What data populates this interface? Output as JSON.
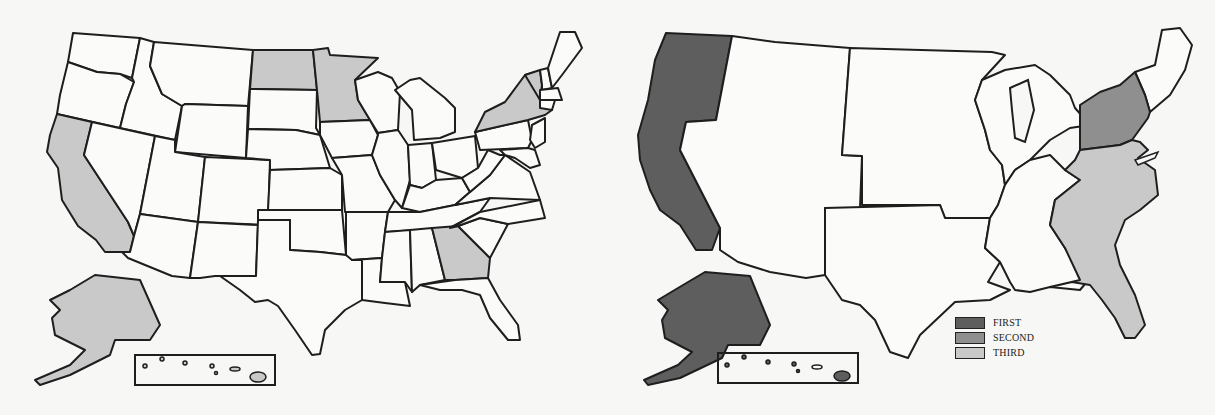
{
  "colors": {
    "background": "#f7f7f5",
    "first": "#5e5e5e",
    "second": "#8f8f8f",
    "third": "#c9c9c9",
    "unshaded": "#fbfbfa",
    "border": "#1e1e1e"
  },
  "left_map": {
    "description": "US states map with individual states shaded",
    "shaded_states": [
      {
        "state": "California",
        "level": "third"
      },
      {
        "state": "North Dakota",
        "level": "third"
      },
      {
        "state": "Minnesota",
        "level": "third"
      },
      {
        "state": "New York",
        "level": "third"
      },
      {
        "state": "Vermont",
        "level": "third"
      },
      {
        "state": "Georgia",
        "level": "third"
      },
      {
        "state": "Alaska",
        "level": "third"
      },
      {
        "state": "Hawaii",
        "level": "third"
      }
    ]
  },
  "right_map": {
    "description": "US regions map with regions shaded",
    "shaded_regions": [
      {
        "region": "Pacific (WA, OR, CA)",
        "level": "first"
      },
      {
        "region": "Alaska",
        "level": "first"
      },
      {
        "region": "Hawaii",
        "level": "first"
      },
      {
        "region": "Mid-Atlantic (NY, NJ, PA)",
        "level": "second"
      },
      {
        "region": "South Atlantic (DE, MD, VA, WV, NC, SC, GA, FL)",
        "level": "third"
      }
    ]
  },
  "legend": {
    "items": [
      {
        "label": "FIRST",
        "level": "first"
      },
      {
        "label": "SECOND",
        "level": "second"
      },
      {
        "label": "THIRD",
        "level": "third"
      }
    ]
  }
}
